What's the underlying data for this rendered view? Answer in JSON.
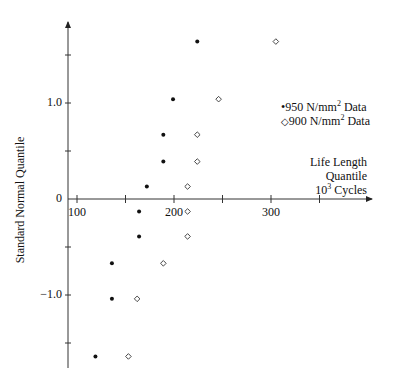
{
  "chart_data": {
    "type": "scatter",
    "title": "",
    "xlabel": "Life Length Quantile 10^3 Cycles",
    "xlabel_lines": [
      "Life Length",
      "Quantile",
      "10",
      "3",
      " Cycles"
    ],
    "ylabel": "Standard Normal Quantile",
    "xlim": [
      90,
      372
    ],
    "ylim": [
      -1.75,
      1.85
    ],
    "x_ticks": [
      100,
      150,
      200,
      250,
      300,
      350
    ],
    "x_tick_labels": [
      "100",
      "200",
      "300"
    ],
    "x_tick_label_values": [
      100,
      200,
      300
    ],
    "y_ticks": [
      -1.5,
      -1.0,
      -0.5,
      0,
      0.5,
      1.0,
      1.5
    ],
    "y_tick_labels": [
      "−1.0",
      "0",
      "1.0"
    ],
    "y_tick_label_values": [
      -1.0,
      0,
      1.0
    ],
    "grid": false,
    "legend_position": "upper right",
    "series": [
      {
        "name": "950 N/mm² Data",
        "legend_label": "950 N/mm",
        "legend_sup": "2",
        "legend_suffix": " Data",
        "marker": "filled-circle",
        "x": [
          119,
          136,
          136,
          164,
          164,
          172,
          189,
          189,
          199,
          224
        ],
        "y": [
          -1.64,
          -1.04,
          -0.67,
          -0.39,
          -0.13,
          0.13,
          0.39,
          0.67,
          1.04,
          1.64
        ]
      },
      {
        "name": "900 N/mm² Data",
        "legend_label": "900 N/mm",
        "legend_sup": "2",
        "legend_suffix": " Data",
        "marker": "open-diamond",
        "x": [
          153,
          162,
          189,
          214,
          214,
          214,
          224,
          224,
          246,
          305
        ],
        "y": [
          -1.64,
          -1.04,
          -0.67,
          -0.39,
          -0.13,
          0.13,
          0.39,
          0.67,
          1.04,
          1.64
        ]
      }
    ]
  }
}
